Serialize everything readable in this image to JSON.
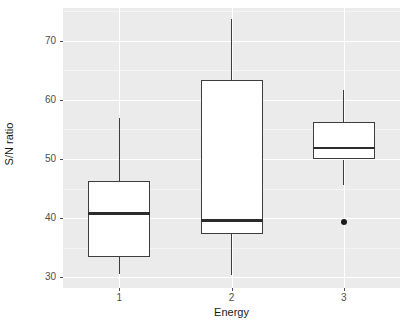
{
  "chart": {
    "type": "boxplot",
    "title": "",
    "xlabel": "Energy",
    "ylabel": "S/N ratio"
  },
  "axes": {
    "y": {
      "ticks": [
        "30",
        "40",
        "50",
        "60",
        "70"
      ],
      "values": [
        30,
        40,
        50,
        60,
        70
      ],
      "min": 28.2,
      "max": 75.5
    },
    "x": {
      "ticks": [
        "1",
        "2",
        "3"
      ],
      "values": [
        1,
        2,
        3
      ]
    }
  },
  "chart_data": {
    "type": "boxplot",
    "title": "",
    "xlabel": "Energy",
    "ylabel": "S/N ratio",
    "categories": [
      "1",
      "2",
      "3"
    ],
    "ylim": [
      28.2,
      75.5
    ],
    "ytick_values": [
      30,
      40,
      50,
      60,
      70
    ],
    "grid": true,
    "legend": "none",
    "boxes": [
      {
        "category": "1",
        "whisker_low": 30.5,
        "q1": 33.4,
        "median": 40.8,
        "q3": 46.3,
        "whisker_high": 56.9,
        "outliers": []
      },
      {
        "category": "2",
        "whisker_low": 30.4,
        "q1": 37.3,
        "median": 39.6,
        "q3": 63.4,
        "whisker_high": 73.6,
        "outliers": []
      },
      {
        "category": "3",
        "whisker_low": 45.6,
        "q1": 49.9,
        "median": 51.8,
        "q3": 56.2,
        "whisker_high": 61.6,
        "outliers": [
          39.3
        ]
      }
    ]
  },
  "colors": {
    "panel_background": "#ebebeb",
    "grid_major": "#ffffff",
    "grid_minor": "#f5f5f5",
    "box_fill": "#ffffff",
    "box_stroke": "#3d3d3d",
    "median_stroke": "#2b2b2b",
    "outlier_fill": "#1a1a1a",
    "text": "#4d4d4d",
    "title_text": "#1a1a1a"
  }
}
